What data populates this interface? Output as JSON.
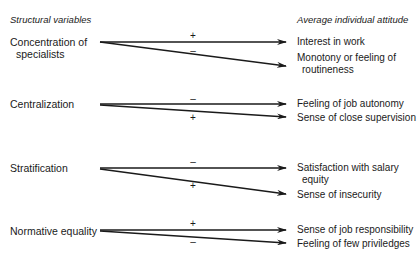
{
  "headers": {
    "left": "Structural variables",
    "right": "Average individual attitude"
  },
  "rows": [
    {
      "variable": [
        "Concentration of",
        "specialists"
      ],
      "outcomes": [
        {
          "sign": "+",
          "attitude": [
            "Interest in work"
          ]
        },
        {
          "sign": "–",
          "attitude": [
            "Monotony or feeling of",
            "routineness"
          ]
        }
      ]
    },
    {
      "variable": [
        "Centralization"
      ],
      "outcomes": [
        {
          "sign": "–",
          "attitude": [
            "Feeling of job autonomy"
          ]
        },
        {
          "sign": "+",
          "attitude": [
            "Sense of close supervision"
          ]
        }
      ]
    },
    {
      "variable": [
        "Stratification"
      ],
      "outcomes": [
        {
          "sign": "–",
          "attitude": [
            "Satisfaction with salary",
            "equity"
          ]
        },
        {
          "sign": "+",
          "attitude": [
            "Sense of insecurity"
          ]
        }
      ]
    },
    {
      "variable": [
        "Normative equality"
      ],
      "outcomes": [
        {
          "sign": "+",
          "attitude": [
            "Sense of job responsibility"
          ]
        },
        {
          "sign": "–",
          "attitude": [
            "Feeling of few priviledges"
          ]
        }
      ]
    }
  ],
  "colors": {
    "ink": "#1a1a1a",
    "background": "#ffffff"
  }
}
